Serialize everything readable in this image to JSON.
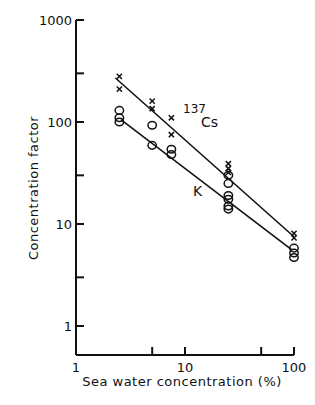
{
  "chart_data": {
    "type": "scatter",
    "title": "",
    "xlabel": "Sea water concentration (%)",
    "ylabel": "Concentration factor",
    "xscale": "log",
    "yscale": "log",
    "xlim": [
      1,
      100
    ],
    "ylim": [
      0.5,
      1000
    ],
    "x_ticks": [
      1,
      10,
      100
    ],
    "x_tick_labels": [
      "1",
      "10",
      "100"
    ],
    "x_minor_ticks": [
      5,
      50
    ],
    "y_ticks": [
      1,
      10,
      100,
      1000
    ],
    "y_tick_labels": [
      "1",
      "10",
      "100",
      "1000"
    ],
    "y_minor_ticks": [
      3,
      30,
      300
    ],
    "grid": false,
    "legend": "inline labels",
    "series": [
      {
        "name": "137Cs",
        "label_sup": "137",
        "label_main": "Cs",
        "marker": "x",
        "points": [
          {
            "x": 2.5,
            "y": 280
          },
          {
            "x": 2.5,
            "y": 210
          },
          {
            "x": 5,
            "y": 160
          },
          {
            "x": 5,
            "y": 135
          },
          {
            "x": 7.5,
            "y": 110
          },
          {
            "x": 7.5,
            "y": 75
          },
          {
            "x": 25,
            "y": 39
          },
          {
            "x": 25,
            "y": 35
          },
          {
            "x": 25,
            "y": 32
          },
          {
            "x": 100,
            "y": 8.1
          },
          {
            "x": 100,
            "y": 7.3
          }
        ],
        "fit_line": [
          {
            "x": 2.3,
            "y": 270
          },
          {
            "x": 100,
            "y": 7.5
          }
        ]
      },
      {
        "name": "K",
        "label_main": "K",
        "marker": "o",
        "points": [
          {
            "x": 2.5,
            "y": 130
          },
          {
            "x": 2.5,
            "y": 110
          },
          {
            "x": 2.5,
            "y": 100
          },
          {
            "x": 5,
            "y": 93
          },
          {
            "x": 5,
            "y": 59
          },
          {
            "x": 7.5,
            "y": 54
          },
          {
            "x": 7.5,
            "y": 48
          },
          {
            "x": 25,
            "y": 30
          },
          {
            "x": 25,
            "y": 25
          },
          {
            "x": 25,
            "y": 19
          },
          {
            "x": 25,
            "y": 17.5
          },
          {
            "x": 25,
            "y": 15
          },
          {
            "x": 25,
            "y": 14
          },
          {
            "x": 100,
            "y": 5.8
          },
          {
            "x": 100,
            "y": 5.2
          },
          {
            "x": 100,
            "y": 4.7
          }
        ],
        "fit_line": [
          {
            "x": 2.6,
            "y": 105
          },
          {
            "x": 95,
            "y": 5.6
          }
        ]
      }
    ]
  }
}
